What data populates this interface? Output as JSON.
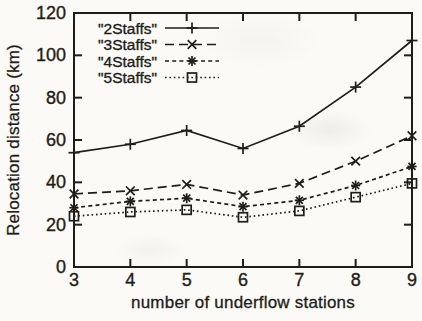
{
  "chart_data": {
    "type": "line",
    "title": "",
    "xlabel": "number of underflow stations",
    "ylabel": "Relocation distance (km)",
    "xlim": [
      3,
      9
    ],
    "ylim": [
      0,
      120
    ],
    "xticks": [
      3,
      4,
      5,
      6,
      7,
      8,
      9
    ],
    "yticks": [
      0,
      20,
      40,
      60,
      80,
      100,
      120
    ],
    "grid": false,
    "legend_position": "top-left",
    "x": [
      3,
      4,
      5,
      6,
      7,
      8,
      9
    ],
    "series": [
      {
        "name": "\"2Staffs\"",
        "line": "solid",
        "marker": "plus",
        "values": [
          54,
          58,
          64.5,
          56,
          66.5,
          85,
          107
        ]
      },
      {
        "name": "\"3Staffs\"",
        "line": "dashed",
        "marker": "x",
        "values": [
          34.5,
          36,
          39,
          34,
          39.5,
          50,
          62
        ]
      },
      {
        "name": "\"4Staffs\"",
        "line": "dense-dashed",
        "marker": "asterisk",
        "values": [
          28,
          31,
          32.5,
          28.5,
          31.5,
          38.5,
          47.5
        ]
      },
      {
        "name": "\"5Staffs\"",
        "line": "dotted",
        "marker": "square",
        "values": [
          24,
          26,
          27,
          23.5,
          26.5,
          33,
          39.5
        ]
      }
    ]
  },
  "colors": {
    "ink": "#1d1d1a",
    "paper": "#fbfaf7"
  }
}
